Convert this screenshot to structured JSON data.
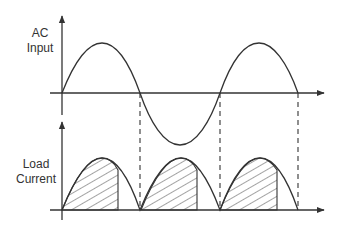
{
  "diagram": {
    "top_plot": {
      "label_line1": "AC",
      "label_line2": "Input",
      "signal": "sine wave (1.5 cycles)"
    },
    "bottom_plot": {
      "label_line1": "Load",
      "label_line2": "Current",
      "signal": "full-wave rectified, hatched conduction region after firing angle"
    },
    "colors": {
      "line": "#333333",
      "background": "#ffffff"
    }
  }
}
